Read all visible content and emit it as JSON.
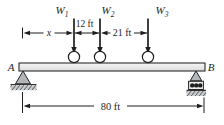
{
  "figure": {
    "kind": "simply-supported-beam-with-three-wheel-loads",
    "colors": {
      "ink": "#1f1f1f",
      "beam_fill_top": "#f6f6f6",
      "beam_fill_bottom": "#dddddd",
      "support_fill": "#b4b7ba",
      "ground_fill": "#c9cccf",
      "hatch_line": "#55585c",
      "roller_box_fill": "#f0f0f0",
      "wheel_fill": "#ffffff"
    },
    "endpoints": {
      "left": "A",
      "right": "B"
    },
    "loads": [
      {
        "base": "W",
        "sub": "1"
      },
      {
        "base": "W",
        "sub": "2"
      },
      {
        "base": "W",
        "sub": "3"
      }
    ],
    "dimensions": {
      "x": "x",
      "w1_w2": "12 ft",
      "w2_w3": "21 ft",
      "span": "80 ft"
    }
  }
}
